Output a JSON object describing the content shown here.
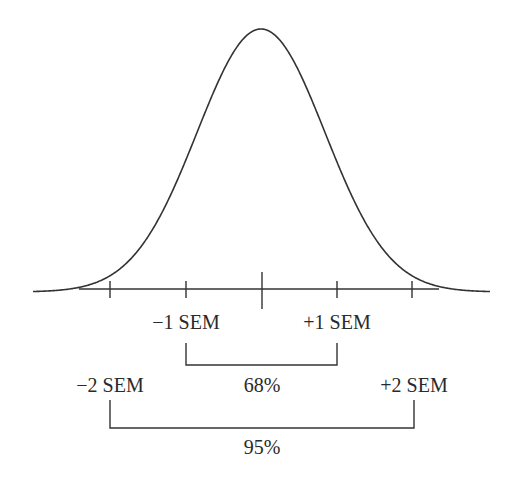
{
  "diagram": {
    "type": "normal-distribution-sem",
    "stroke_color": "#333333",
    "background": "#ffffff",
    "curve": {
      "peak_x": 261,
      "peak_y": 29,
      "baseline_y": 292,
      "sigma_px": 64,
      "x_start": 33,
      "x_end": 490
    },
    "axis": {
      "y": 289,
      "x_start": 79,
      "x_end": 439
    },
    "ticks": [
      {
        "x": 110,
        "len_up": 8,
        "len_down": 9
      },
      {
        "x": 186,
        "len_up": 8,
        "len_down": 9
      },
      {
        "x": 262,
        "len_up": 17,
        "len_down": 20
      },
      {
        "x": 337,
        "len_up": 8,
        "len_down": 9
      },
      {
        "x": 412,
        "len_up": 8,
        "len_down": 9
      }
    ],
    "labels": {
      "minus1": {
        "text": "−1 SEM",
        "x": 186,
        "y": 312
      },
      "plus1": {
        "text": "+1 SEM",
        "x": 337,
        "y": 312
      },
      "minus2": {
        "text": "−2 SEM",
        "x": 110,
        "y": 375
      },
      "plus2": {
        "text": "+2 SEM",
        "x": 414,
        "y": 375
      },
      "pct68": {
        "text": "68%",
        "x": 262,
        "y": 375
      },
      "pct95": {
        "text": "95%",
        "x": 262,
        "y": 437
      }
    },
    "brackets": [
      {
        "name": "bracket-68",
        "x1": 186,
        "x2": 337,
        "y_top": 343,
        "y_bottom": 365
      },
      {
        "name": "bracket-95",
        "x1": 110,
        "x2": 414,
        "y_top": 400,
        "y_bottom": 428
      }
    ]
  }
}
